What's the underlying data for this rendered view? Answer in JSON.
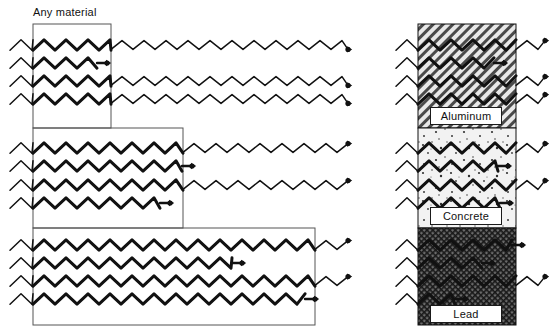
{
  "figure": {
    "title_label": "Any material",
    "background_color": "#ffffff",
    "stroke_color": "#111111"
  },
  "left_panel": {
    "label": "Any material",
    "groups": [
      {
        "name": "thin-slab",
        "rect": {
          "x": 33,
          "y": 24,
          "width": 78,
          "height": 104
        },
        "rays": [
          {
            "penetrates": true,
            "stop_x": 348
          },
          {
            "penetrates": false,
            "stop_x": 97
          },
          {
            "penetrates": true,
            "stop_x": 348
          },
          {
            "penetrates": true,
            "stop_x": 348
          }
        ]
      },
      {
        "name": "medium-slab",
        "rect": {
          "x": 33,
          "y": 128,
          "width": 150,
          "height": 100
        },
        "rays": [
          {
            "penetrates": true,
            "stop_x": 348
          },
          {
            "penetrates": false,
            "stop_x": 182
          },
          {
            "penetrates": true,
            "stop_x": 348
          },
          {
            "penetrates": false,
            "stop_x": 160
          }
        ]
      },
      {
        "name": "thick-slab",
        "rect": {
          "x": 33,
          "y": 228,
          "width": 282,
          "height": 97
        },
        "rays": [
          {
            "penetrates": true,
            "stop_x": 348
          },
          {
            "penetrates": false,
            "stop_x": 232
          },
          {
            "penetrates": true,
            "stop_x": 348
          },
          {
            "penetrates": false,
            "stop_x": 305
          }
        ]
      }
    ]
  },
  "right_panel": {
    "blocks": [
      {
        "name": "aluminum-block",
        "label": "Aluminum",
        "pattern": "diagonal-hatch",
        "rect": {
          "x": 418,
          "y": 24,
          "width": 98,
          "height": 104
        },
        "rays": [
          {
            "penetrates": true,
            "stop_x": 545
          },
          {
            "penetrates": false,
            "stop_x": 494
          },
          {
            "penetrates": true,
            "stop_x": 545
          },
          {
            "penetrates": true,
            "stop_x": 545
          }
        ]
      },
      {
        "name": "concrete-block",
        "label": "Concrete",
        "pattern": "stipple",
        "rect": {
          "x": 418,
          "y": 128,
          "width": 98,
          "height": 100
        },
        "rays": [
          {
            "penetrates": true,
            "stop_x": 545
          },
          {
            "penetrates": false,
            "stop_x": 498
          },
          {
            "penetrates": true,
            "stop_x": 545
          },
          {
            "penetrates": false,
            "stop_x": 500
          }
        ]
      },
      {
        "name": "lead-block",
        "label": "Lead",
        "pattern": "cross-hatch-dense",
        "rect": {
          "x": 418,
          "y": 228,
          "width": 98,
          "height": 97
        },
        "rays": [
          {
            "penetrates": false,
            "stop_x": 512
          },
          {
            "penetrates": false,
            "stop_x": 482
          },
          {
            "penetrates": true,
            "stop_x": 545
          },
          {
            "penetrates": false,
            "stop_x": 455
          }
        ]
      }
    ]
  },
  "ray_rows": {
    "group1_y": [
      45,
      63,
      81,
      99
    ],
    "group2_y": [
      148,
      166,
      185,
      203
    ],
    "group3_y": [
      245,
      263,
      281,
      299
    ]
  }
}
